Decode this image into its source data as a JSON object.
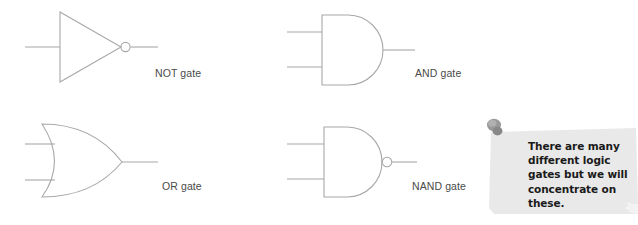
{
  "page": {
    "title": "Logic Gates",
    "background_color": "#ffffff",
    "line_color": "#a8a8a8",
    "label_color": "#4a4a4a"
  },
  "gates": [
    {
      "id": "not",
      "label": "NOT gate",
      "symbol": "not-gate-symbol",
      "inputs": 1,
      "inverted_output": true
    },
    {
      "id": "and",
      "label": "AND gate",
      "symbol": "and-gate-symbol",
      "inputs": 2,
      "inverted_output": false
    },
    {
      "id": "or",
      "label": "OR gate",
      "symbol": "or-gate-symbol",
      "inputs": 2,
      "inverted_output": false
    },
    {
      "id": "nand",
      "label": "NAND gate",
      "symbol": "nand-gate-symbol",
      "inputs": 2,
      "inverted_output": true
    }
  ],
  "labels": {
    "not": "NOT gate",
    "and": "AND gate",
    "or": "OR gate",
    "nand": "NAND gate"
  },
  "sticky_note": {
    "text": "There are many different logic gates but we will concentrate on these.",
    "paper_color": "#e9e9e9",
    "pin_color": "#8f8f8f",
    "text_color": "#1a1a1a"
  }
}
